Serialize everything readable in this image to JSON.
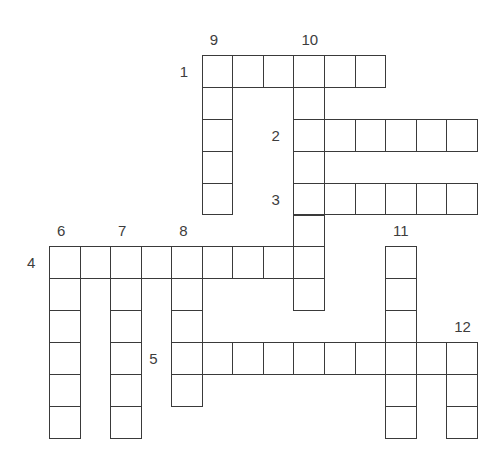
{
  "puzzle": {
    "type": "crossword",
    "words": [
      {
        "number": "1",
        "direction": "across",
        "row": 0,
        "col": 5,
        "length": 6
      },
      {
        "number": "2",
        "direction": "across",
        "row": 2,
        "col": 8,
        "length": 6
      },
      {
        "number": "3",
        "direction": "across",
        "row": 4,
        "col": 8,
        "length": 6
      },
      {
        "number": "4",
        "direction": "across",
        "row": 6,
        "col": 0,
        "length": 9
      },
      {
        "number": "5",
        "direction": "across",
        "row": 9,
        "col": 4,
        "length": 10
      },
      {
        "number": "6",
        "direction": "down",
        "row": 6,
        "col": 0,
        "length": 6
      },
      {
        "number": "7",
        "direction": "down",
        "row": 6,
        "col": 2,
        "length": 6
      },
      {
        "number": "8",
        "direction": "down",
        "row": 6,
        "col": 4,
        "length": 5
      },
      {
        "number": "9",
        "direction": "down",
        "row": 0,
        "col": 5,
        "length": 5
      },
      {
        "number": "10",
        "direction": "down",
        "row": 0,
        "col": 8,
        "length": 8
      },
      {
        "number": "11",
        "direction": "down",
        "row": 6,
        "col": 11,
        "length": 6
      },
      {
        "number": "12",
        "direction": "down",
        "row": 9,
        "col": 13,
        "length": 3
      }
    ]
  },
  "colors": {
    "grid_line": "#3a3a3a",
    "label": "#3d3d3d",
    "background": "#ffffff"
  }
}
